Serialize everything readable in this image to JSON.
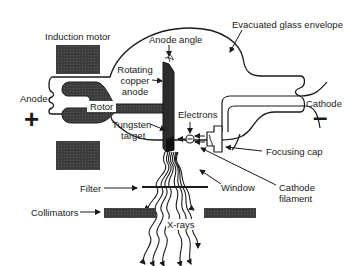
{
  "diagram": {
    "labels": {
      "induction_motor": "Induction motor",
      "anode_angle": "Anode angle",
      "evacuated_glass_envelope": "Evacuated glass envelope",
      "rotating_copper_anode_1": "Rotating",
      "rotating_copper_anode_2": "copper",
      "rotating_copper_anode_3": "anode",
      "anode": "Anode",
      "anode_sign": "+",
      "rotor": "Rotor",
      "tungsten_target_1": "Tungsten",
      "tungsten_target_2": "target",
      "electrons": "Electrons",
      "cathode": "Cathode",
      "cathode_sign": "–",
      "focusing_cap": "Focusing cap",
      "filter": "Filter",
      "window": "Window",
      "cathode_filament_1": "Cathode",
      "cathode_filament_2": "filament",
      "collimators": "Collimators",
      "x_rays": "X-rays",
      "angle_symbol": "θ"
    },
    "colors": {
      "ink": "#1a1a1a",
      "fill_dark": "#3a3a3a",
      "fill_block": "#4a4a4a",
      "background": "#ffffff"
    }
  }
}
